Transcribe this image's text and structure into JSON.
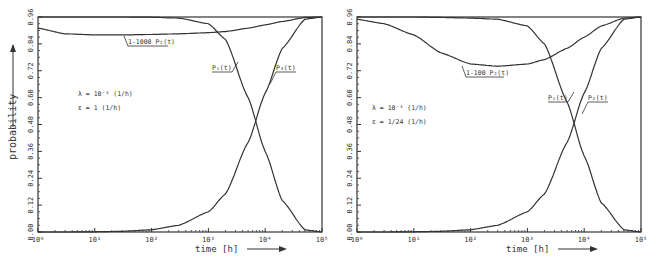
{
  "chart_data": [
    {
      "type": "line",
      "title": "",
      "xlabel": "time [h]",
      "ylabel": "probability",
      "xscale": "log",
      "xlim": [
        1,
        100000
      ],
      "ylim": [
        0.0,
        0.96
      ],
      "x_ticks": [
        "10⁰",
        "10¹",
        "10²",
        "10³",
        "10⁴",
        "10⁵"
      ],
      "y_ticks": [
        "0.00",
        "0.12",
        "0.24",
        "0.36",
        "0.48",
        "0.60",
        "0.72",
        "0.84",
        "0.96"
      ],
      "annotations": [
        "λ = 10⁻⁴ (1/h)",
        "ε = 1 (1/h)"
      ],
      "x": [
        1,
        3,
        10,
        30,
        100,
        300,
        1000,
        2000,
        5000,
        10000,
        20000,
        50000,
        100000
      ],
      "series": [
        {
          "name": "P₁(t)",
          "values": [
            0.96,
            0.96,
            0.96,
            0.96,
            0.959,
            0.955,
            0.93,
            0.86,
            0.6,
            0.36,
            0.14,
            0.01,
            0.0
          ]
        },
        {
          "name": "P₃(t)",
          "values": [
            0.0,
            0.0,
            0.001,
            0.003,
            0.01,
            0.03,
            0.09,
            0.17,
            0.4,
            0.62,
            0.82,
            0.95,
            0.96
          ]
        },
        {
          "name": "1-1000 P₂(t)",
          "values": [
            0.91,
            0.885,
            0.88,
            0.88,
            0.882,
            0.885,
            0.89,
            0.895,
            0.91,
            0.925,
            0.94,
            0.958,
            0.96
          ]
        }
      ]
    },
    {
      "type": "line",
      "title": "",
      "xlabel": "time [h]",
      "ylabel": "probability",
      "xscale": "log",
      "xlim": [
        1,
        100000
      ],
      "ylim": [
        0.0,
        0.96
      ],
      "x_ticks": [
        "10⁰",
        "10¹",
        "10²",
        "10³",
        "10⁴",
        "10⁵"
      ],
      "y_ticks": [
        "0.00",
        "0.12",
        "0.24",
        "0.36",
        "0.48",
        "0.60",
        "0.72",
        "0.84",
        "0.96"
      ],
      "annotations": [
        "λ = 10⁻⁴ (1/h)",
        "ε = 1/24 (1/h)"
      ],
      "x": [
        1,
        3,
        10,
        30,
        100,
        300,
        1000,
        2000,
        5000,
        10000,
        20000,
        50000,
        100000
      ],
      "series": [
        {
          "name": "P₁(t)",
          "values": [
            0.96,
            0.96,
            0.96,
            0.958,
            0.955,
            0.95,
            0.92,
            0.84,
            0.58,
            0.34,
            0.13,
            0.01,
            0.0
          ]
        },
        {
          "name": "P₂(t)",
          "values": [
            0.0,
            0.0,
            0.001,
            0.003,
            0.01,
            0.03,
            0.09,
            0.17,
            0.4,
            0.62,
            0.82,
            0.95,
            0.96
          ]
        },
        {
          "name": "1-100 P₂(t)",
          "values": [
            0.95,
            0.93,
            0.88,
            0.8,
            0.75,
            0.74,
            0.75,
            0.77,
            0.82,
            0.87,
            0.92,
            0.955,
            0.96
          ]
        }
      ]
    }
  ],
  "labels": {
    "ylabel": "probability",
    "xlabel": "time [h]",
    "left": {
      "lambda": "λ = 10⁻⁴",
      "lambda_unit": "(1/h)",
      "eps": "ε =  1",
      "eps_unit": "(1/h)",
      "curve_p1": "P₁(t)",
      "curve_p3": "P₃(t)",
      "curve_p2": "1-1000 P₂(t)"
    },
    "right": {
      "lambda": "λ = 10⁻⁴",
      "lambda_unit": "(1/h)",
      "eps": "ε = 1/24",
      "eps_unit": "(1/h)",
      "curve_p1": "P₁(t)",
      "curve_p3": "P₂(t)",
      "curve_p2": "1-100 P₂(t)"
    }
  }
}
